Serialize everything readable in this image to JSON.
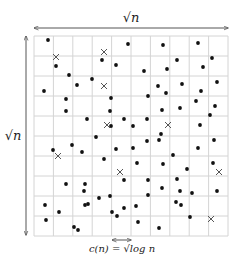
{
  "diagram": {
    "title": "",
    "labels": {
      "top": "√n",
      "left": "√n",
      "bottom": "c(n) = √log n"
    },
    "grid": {
      "rows": 10,
      "cols": 10,
      "x0": 34,
      "y0": 36,
      "x1": 228,
      "y1": 236,
      "line_color": "#d4d4d4",
      "border_color": "#c8c8c8"
    },
    "arrows": {
      "top": {
        "x1": 34,
        "x2": 228,
        "y": 28
      },
      "left": {
        "x": 26,
        "y1": 36,
        "y2": 235
      },
      "bottom": {
        "x1": 112,
        "x2": 131,
        "y": 240
      },
      "color": "#555555"
    },
    "dot_color": "#111111",
    "cross_color": "#555555",
    "dots": [
      [
        48,
        40
      ],
      [
        128,
        44
      ],
      [
        163,
        45
      ],
      [
        198,
        43
      ],
      [
        102,
        60
      ],
      [
        56,
        66
      ],
      [
        116,
        65
      ],
      [
        177,
        60
      ],
      [
        212,
        58
      ],
      [
        203,
        67
      ],
      [
        144,
        71
      ],
      [
        167,
        69
      ],
      [
        69,
        75
      ],
      [
        92,
        79
      ],
      [
        77,
        85
      ],
      [
        44,
        91
      ],
      [
        158,
        86
      ],
      [
        182,
        84
      ],
      [
        217,
        82
      ],
      [
        166,
        93
      ],
      [
        201,
        91
      ],
      [
        66,
        99
      ],
      [
        111,
        98
      ],
      [
        148,
        96
      ],
      [
        196,
        101
      ],
      [
        66,
        111
      ],
      [
        110,
        111
      ],
      [
        162,
        110
      ],
      [
        180,
        108
      ],
      [
        215,
        106
      ],
      [
        210,
        115
      ],
      [
        87,
        119
      ],
      [
        124,
        119
      ],
      [
        147,
        119
      ],
      [
        111,
        126
      ],
      [
        133,
        126
      ],
      [
        200,
        125
      ],
      [
        161,
        134
      ],
      [
        96,
        137
      ],
      [
        72,
        145
      ],
      [
        147,
        141
      ],
      [
        159,
        140
      ],
      [
        214,
        140
      ],
      [
        53,
        150
      ],
      [
        82,
        152
      ],
      [
        116,
        149
      ],
      [
        133,
        148
      ],
      [
        198,
        148
      ],
      [
        173,
        155
      ],
      [
        104,
        159
      ],
      [
        137,
        163
      ],
      [
        163,
        164
      ],
      [
        213,
        163
      ],
      [
        187,
        169
      ],
      [
        124,
        180
      ],
      [
        148,
        180
      ],
      [
        177,
        179
      ],
      [
        66,
        184
      ],
      [
        85,
        184
      ],
      [
        84,
        191
      ],
      [
        162,
        188
      ],
      [
        180,
        191
      ],
      [
        192,
        193
      ],
      [
        217,
        191
      ],
      [
        99,
        198
      ],
      [
        110,
        196
      ],
      [
        148,
        195
      ],
      [
        45,
        205
      ],
      [
        85,
        205
      ],
      [
        88,
        204
      ],
      [
        136,
        206
      ],
      [
        124,
        208
      ],
      [
        176,
        202
      ],
      [
        181,
        205
      ],
      [
        59,
        212
      ],
      [
        112,
        212
      ],
      [
        117,
        216
      ],
      [
        190,
        217
      ],
      [
        46,
        220
      ],
      [
        138,
        222
      ],
      [
        74,
        227
      ],
      [
        78,
        230
      ],
      [
        159,
        228
      ]
    ],
    "crosses": [
      [
        56,
        57
      ],
      [
        104,
        52
      ],
      [
        104,
        86
      ],
      [
        107,
        125
      ],
      [
        168,
        125
      ],
      [
        58,
        156
      ],
      [
        120,
        172
      ],
      [
        219,
        172
      ],
      [
        211,
        219
      ]
    ]
  }
}
